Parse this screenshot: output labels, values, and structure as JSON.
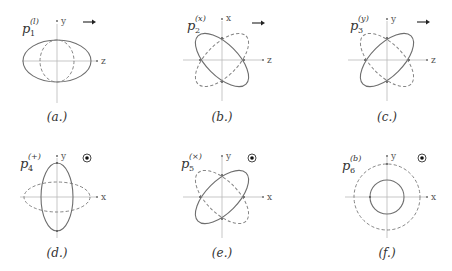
{
  "figure": {
    "colors": {
      "solid_curve": "#6e6e6e",
      "dashed_curve": "#858585",
      "axis": "#b9b9b9",
      "text": "#333333"
    },
    "panels": [
      {
        "id": "a",
        "caption": "(a.)",
        "mode_symbol": "p",
        "mode_subscript": "1",
        "mode_superscript": "(l)",
        "vertical_axis": "y",
        "horizontal_axis": "z",
        "propagation_indicator": "arrow-right",
        "propagation_glyph": "→",
        "solid_shape": "ellipse elongated along z",
        "dashed_shape": "ellipse compressed along z"
      },
      {
        "id": "b",
        "caption": "(b.)",
        "mode_symbol": "p",
        "mode_subscript": "2",
        "mode_superscript": "(x)",
        "vertical_axis": "x",
        "horizontal_axis": "z",
        "propagation_indicator": "arrow-right",
        "propagation_glyph": "→",
        "solid_shape": "ellipse tilted -45°",
        "dashed_shape": "ellipse tilted +45°"
      },
      {
        "id": "c",
        "caption": "(c.)",
        "mode_symbol": "p",
        "mode_subscript": "3",
        "mode_superscript": "(y)",
        "vertical_axis": "y",
        "horizontal_axis": "z",
        "propagation_indicator": "arrow-right",
        "propagation_glyph": "→",
        "solid_shape": "ellipse tilted +45°",
        "dashed_shape": "ellipse tilted -45°"
      },
      {
        "id": "d",
        "caption": "(d.)",
        "mode_symbol": "p",
        "mode_subscript": "4",
        "mode_superscript": "(+)",
        "vertical_axis": "y",
        "horizontal_axis": "x",
        "propagation_indicator": "out-of-page",
        "propagation_glyph": "⊙",
        "solid_shape": "ellipse elongated along y",
        "dashed_shape": "ellipse elongated along x"
      },
      {
        "id": "e",
        "caption": "(e.)",
        "mode_symbol": "p",
        "mode_subscript": "5",
        "mode_superscript": "(×)",
        "vertical_axis": "y",
        "horizontal_axis": "x",
        "propagation_indicator": "out-of-page",
        "propagation_glyph": "⊙",
        "solid_shape": "ellipse tilted +45°",
        "dashed_shape": "ellipse tilted -45°"
      },
      {
        "id": "f",
        "caption": "(f.)",
        "mode_symbol": "p",
        "mode_subscript": "6",
        "mode_superscript": "(b)",
        "vertical_axis": "y",
        "horizontal_axis": "x",
        "propagation_indicator": "out-of-page",
        "propagation_glyph": "⊙",
        "solid_shape": "small circle",
        "dashed_shape": "large circle"
      }
    ]
  }
}
